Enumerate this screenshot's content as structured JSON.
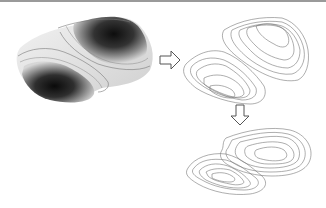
{
  "diagram": {
    "panels": [
      {
        "id": "surface",
        "label": "shaded-3d-surface"
      },
      {
        "id": "contours-3d",
        "label": "3d-contour-lines"
      },
      {
        "id": "contours-2d",
        "label": "2d-contour-lines"
      }
    ],
    "arrows": [
      {
        "from": "surface",
        "to": "contours-3d",
        "direction": "right"
      },
      {
        "from": "contours-3d",
        "to": "contours-2d",
        "direction": "down"
      }
    ],
    "colors": {
      "border": "#9a9a9a",
      "line": "#707070",
      "surface_light": "#e8e8e8",
      "surface_dark": "#111111"
    }
  }
}
